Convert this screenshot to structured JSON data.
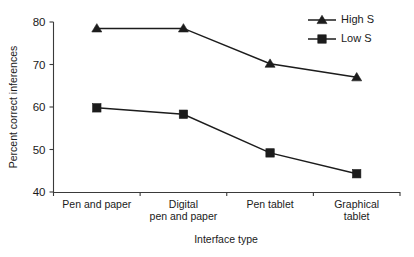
{
  "chart_data": {
    "type": "line",
    "title": "",
    "xlabel": "Interface type",
    "ylabel": "Percent correct inferences",
    "categories": [
      "Pen and paper",
      "Digital pen and paper",
      "Pen tablet",
      "Graphical tablet"
    ],
    "category_lines": [
      [
        "Pen and paper"
      ],
      [
        "Digital",
        "pen and paper"
      ],
      [
        "Pen tablet"
      ],
      [
        "Graphical",
        "tablet"
      ]
    ],
    "ylim": [
      40,
      80
    ],
    "yticks": [
      40,
      50,
      60,
      70,
      80
    ],
    "ytick_labels": [
      "40",
      "50",
      "60",
      "70",
      "80"
    ],
    "grid": false,
    "legend_position": "top-right",
    "series": [
      {
        "name": "High S",
        "marker": "triangle",
        "color": "#1c1c1c",
        "values": [
          78.5,
          78.5,
          70.2,
          67.0
        ]
      },
      {
        "name": "Low S",
        "marker": "square",
        "color": "#1c1c1c",
        "values": [
          59.8,
          58.3,
          49.2,
          44.3
        ]
      }
    ]
  },
  "legend": {
    "entries": [
      {
        "label": "High S"
      },
      {
        "label": "Low S"
      }
    ]
  },
  "axes": {
    "y_title": "Percent correct inferences",
    "x_title": "Interface type"
  }
}
